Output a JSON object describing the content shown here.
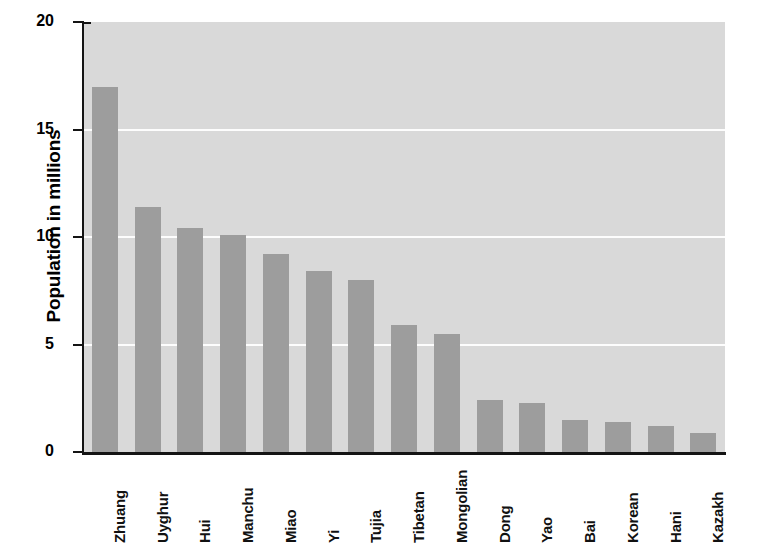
{
  "chart_data": {
    "type": "bar",
    "title": "",
    "xlabel": "",
    "ylabel": "Population in millions",
    "ylim": [
      0,
      20
    ],
    "yticks": [
      0,
      5,
      10,
      15,
      20
    ],
    "ytick_labels": [
      "0",
      "5",
      "10",
      "15",
      "20"
    ],
    "grid": true,
    "gridlines_at": [
      5,
      10,
      15
    ],
    "legend": "none",
    "categories": [
      "Zhuang",
      "Uyghur",
      "Hui",
      "Manchu",
      "Miao",
      "Yi",
      "Tujia",
      "Tibetan",
      "Mongolian",
      "Dong",
      "Yao",
      "Bai",
      "Korean",
      "Hani",
      "Kazakh"
    ],
    "values": [
      17.0,
      11.4,
      10.4,
      10.1,
      9.2,
      8.4,
      8.0,
      5.9,
      5.5,
      2.4,
      2.3,
      1.5,
      1.4,
      1.2,
      0.9
    ],
    "series": [
      {
        "name": "Population in millions",
        "values": [
          17.0,
          11.4,
          10.4,
          10.1,
          9.2,
          8.4,
          8.0,
          5.9,
          5.5,
          2.4,
          2.3,
          1.5,
          1.4,
          1.2,
          0.9
        ]
      }
    ],
    "colors": {
      "bar": "#9d9d9d",
      "plot_background": "#d9d9d9",
      "gridline": "#fdfdfd",
      "axis": "#141414",
      "text": "#000000",
      "page_background": "#ffffff"
    }
  }
}
